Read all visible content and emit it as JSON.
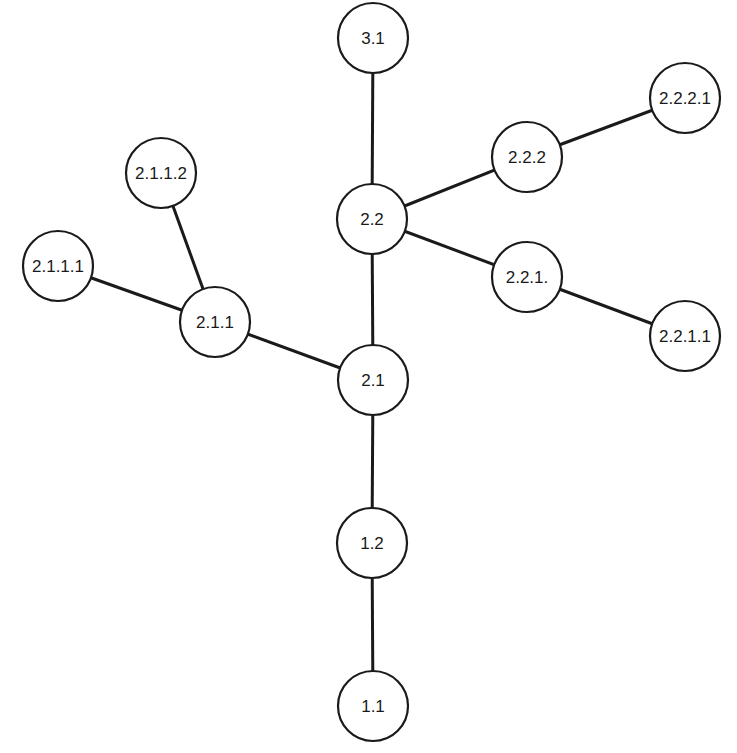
{
  "diagram": {
    "type": "tree",
    "node_radius": 35,
    "colors": {
      "stroke": "#1a1a1a",
      "fill": "#ffffff",
      "background": "#ffffff"
    },
    "nodes": [
      {
        "id": "n31",
        "label": "3.1",
        "x": 373,
        "y": 38
      },
      {
        "id": "n2221",
        "label": "2.2.2.1",
        "x": 685,
        "y": 98
      },
      {
        "id": "n222",
        "label": "2.2.2",
        "x": 527,
        "y": 157
      },
      {
        "id": "n22",
        "label": "2.2",
        "x": 372,
        "y": 219
      },
      {
        "id": "n221",
        "label": "2.2.1.",
        "x": 527,
        "y": 277
      },
      {
        "id": "n2211",
        "label": "2.2.1.1",
        "x": 685,
        "y": 336
      },
      {
        "id": "n2112",
        "label": "2.1.1.2",
        "x": 161,
        "y": 173
      },
      {
        "id": "n2111",
        "label": "2.1.1.1",
        "x": 58,
        "y": 266
      },
      {
        "id": "n211",
        "label": "2.1.1",
        "x": 215,
        "y": 322
      },
      {
        "id": "n21",
        "label": "2.1",
        "x": 373,
        "y": 380
      },
      {
        "id": "n12",
        "label": "1.2",
        "x": 372,
        "y": 543
      },
      {
        "id": "n11",
        "label": "1.1",
        "x": 373,
        "y": 706
      }
    ],
    "edges": [
      {
        "from": "n31",
        "to": "n22"
      },
      {
        "from": "n22",
        "to": "n222"
      },
      {
        "from": "n222",
        "to": "n2221"
      },
      {
        "from": "n22",
        "to": "n221"
      },
      {
        "from": "n221",
        "to": "n2211"
      },
      {
        "from": "n22",
        "to": "n21"
      },
      {
        "from": "n21",
        "to": "n211"
      },
      {
        "from": "n211",
        "to": "n2112"
      },
      {
        "from": "n211",
        "to": "n2111"
      },
      {
        "from": "n21",
        "to": "n12"
      },
      {
        "from": "n12",
        "to": "n11"
      }
    ]
  }
}
